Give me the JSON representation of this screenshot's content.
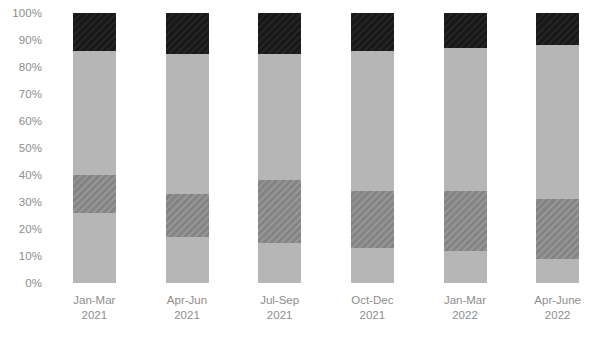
{
  "chart_data": {
    "type": "bar",
    "subtype": "stacked-bar-100-percent",
    "title": "",
    "subtitle": "",
    "xlabel": "",
    "ylabel": "",
    "ylim": [
      0,
      100
    ],
    "grid": false,
    "legend": "none",
    "orientation": "vertical",
    "stacked": true,
    "value_unit": "%",
    "categories": [
      "Jan-Mar 2021",
      "Apr-Jun 2021",
      "Jul-Sep 2021",
      "Oct-Dec 2021",
      "Jan-Mar 2022",
      "Apr-June 2022"
    ],
    "category_lines": [
      [
        "Jan-Mar",
        "2021"
      ],
      [
        "Apr-Jun",
        "2021"
      ],
      [
        "Jul-Sep",
        "2021"
      ],
      [
        "Oct-Dec",
        "2021"
      ],
      [
        "Jan-Mar",
        "2022"
      ],
      [
        "Apr-June",
        "2022"
      ]
    ],
    "y_ticks": [
      0,
      10,
      20,
      30,
      40,
      50,
      60,
      70,
      80,
      90,
      100
    ],
    "y_tick_labels": [
      "0%",
      "10%",
      "20%",
      "30%",
      "40%",
      "50%",
      "60%",
      "70%",
      "80%",
      "90%",
      "100%"
    ],
    "series": [
      {
        "name": "segment-1-light-gray",
        "style": "solid",
        "color": "#b6b6b6",
        "values": [
          26,
          17,
          15,
          13,
          12,
          9
        ]
      },
      {
        "name": "segment-2-dark-gray-hatched",
        "style": "hatched",
        "color": "#8a8a8a",
        "values": [
          14,
          16,
          23,
          21,
          22,
          22
        ]
      },
      {
        "name": "segment-3-medium-gray",
        "style": "solid",
        "color": "#b6b6b6",
        "values": [
          46,
          52,
          47,
          52,
          53,
          57
        ]
      },
      {
        "name": "segment-4-black",
        "style": "solid",
        "color": "#1b1b1b",
        "values": [
          14,
          15,
          15,
          14,
          13,
          12
        ]
      }
    ],
    "cumulative_tops": [
      [
        26,
        40,
        86,
        100
      ],
      [
        17,
        33,
        85,
        100
      ],
      [
        15,
        38,
        85,
        100
      ],
      [
        13,
        34,
        86,
        100
      ],
      [
        12,
        34,
        87,
        100
      ],
      [
        9,
        31,
        88,
        100
      ]
    ]
  },
  "axis": {
    "y_top_value": 100,
    "y_bottom_value": 0
  },
  "colors": {
    "light_gray": "#b6b6b6",
    "hatched_gray": "#8a8a8a",
    "medium_gray": "#b6b6b6",
    "black": "#1b1b1b",
    "tick_text": "#8d8d8d",
    "background": "#ffffff"
  }
}
